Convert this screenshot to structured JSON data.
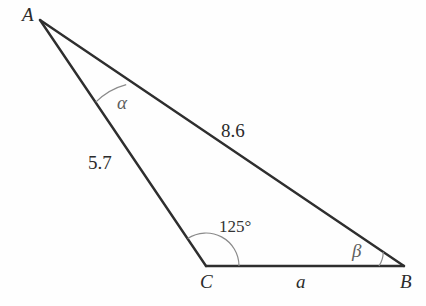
{
  "figure": {
    "kind": "triangle-diagram",
    "background_color": "#fefefe",
    "line_color": "#2e2e2e",
    "arc_color": "#8a8a8a",
    "vertices": [
      {
        "name": "A",
        "label": "A",
        "x": 40,
        "y": 20
      },
      {
        "name": "B",
        "label": "B",
        "x": 404,
        "y": 266
      },
      {
        "name": "C",
        "label": "C",
        "x": 206,
        "y": 266
      }
    ],
    "sides": [
      {
        "name": "side-AB",
        "label": "8.6",
        "from": "A",
        "to": "B"
      },
      {
        "name": "side-AC",
        "label": "5.7",
        "from": "A",
        "to": "C"
      },
      {
        "name": "side-CB",
        "label": "a",
        "from": "C",
        "to": "B"
      }
    ],
    "angles": [
      {
        "name": "angle-A",
        "label": "α",
        "at": "A"
      },
      {
        "name": "angle-C",
        "label": "125°",
        "at": "C"
      },
      {
        "name": "angle-B",
        "label": "β",
        "at": "B"
      }
    ]
  },
  "labels": {
    "vertex_a": "A",
    "vertex_b": "B",
    "vertex_c": "C",
    "side_ab": "8.6",
    "side_ac": "5.7",
    "side_cb": "a",
    "angle_a": "α",
    "angle_b": "β",
    "angle_c": "125°"
  }
}
